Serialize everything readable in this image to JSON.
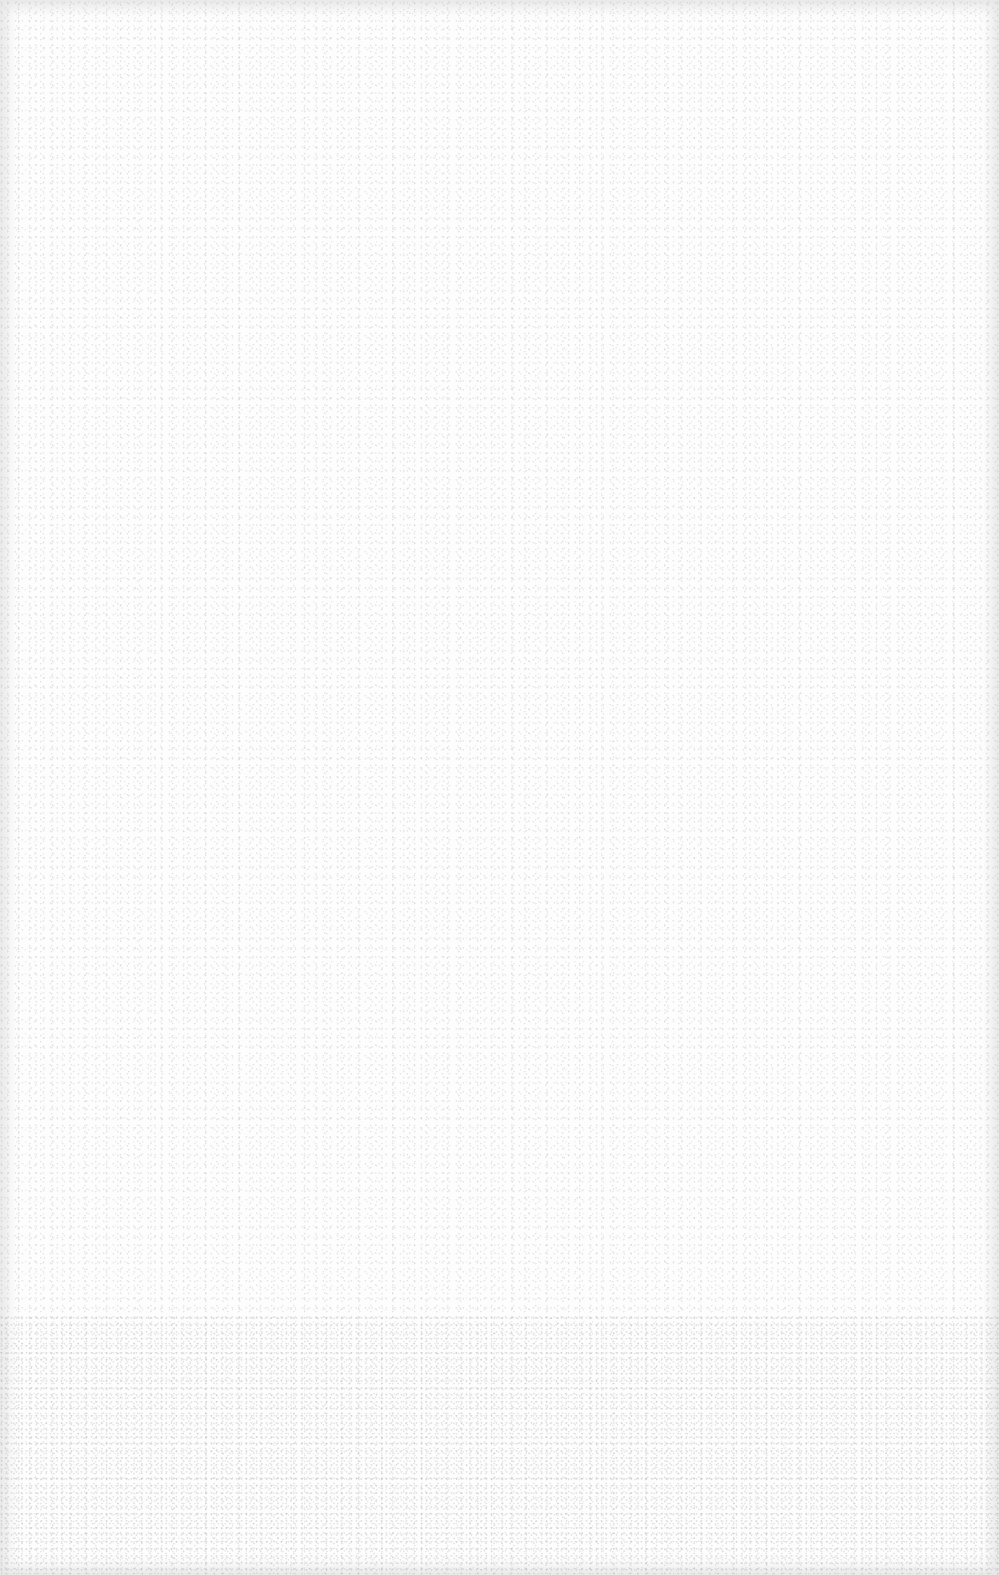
{
  "document": {
    "type": "blank-page",
    "background_color": "#fdfdfd",
    "content": ""
  }
}
